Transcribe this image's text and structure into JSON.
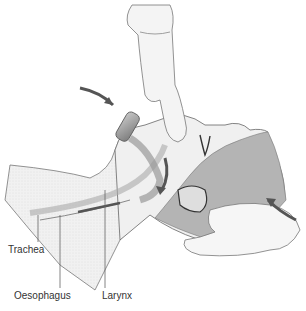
{
  "figure": {
    "labels": {
      "trachea": "Trachea",
      "oesophagus": "Oesophagus",
      "larynx": "Larynx"
    },
    "colors": {
      "skin": "#ececec",
      "hair": "#a9a9a9",
      "tube": "#8a8a8a",
      "arrow": "#555555",
      "line": "#666666",
      "shade": "#d9d9d9"
    }
  }
}
